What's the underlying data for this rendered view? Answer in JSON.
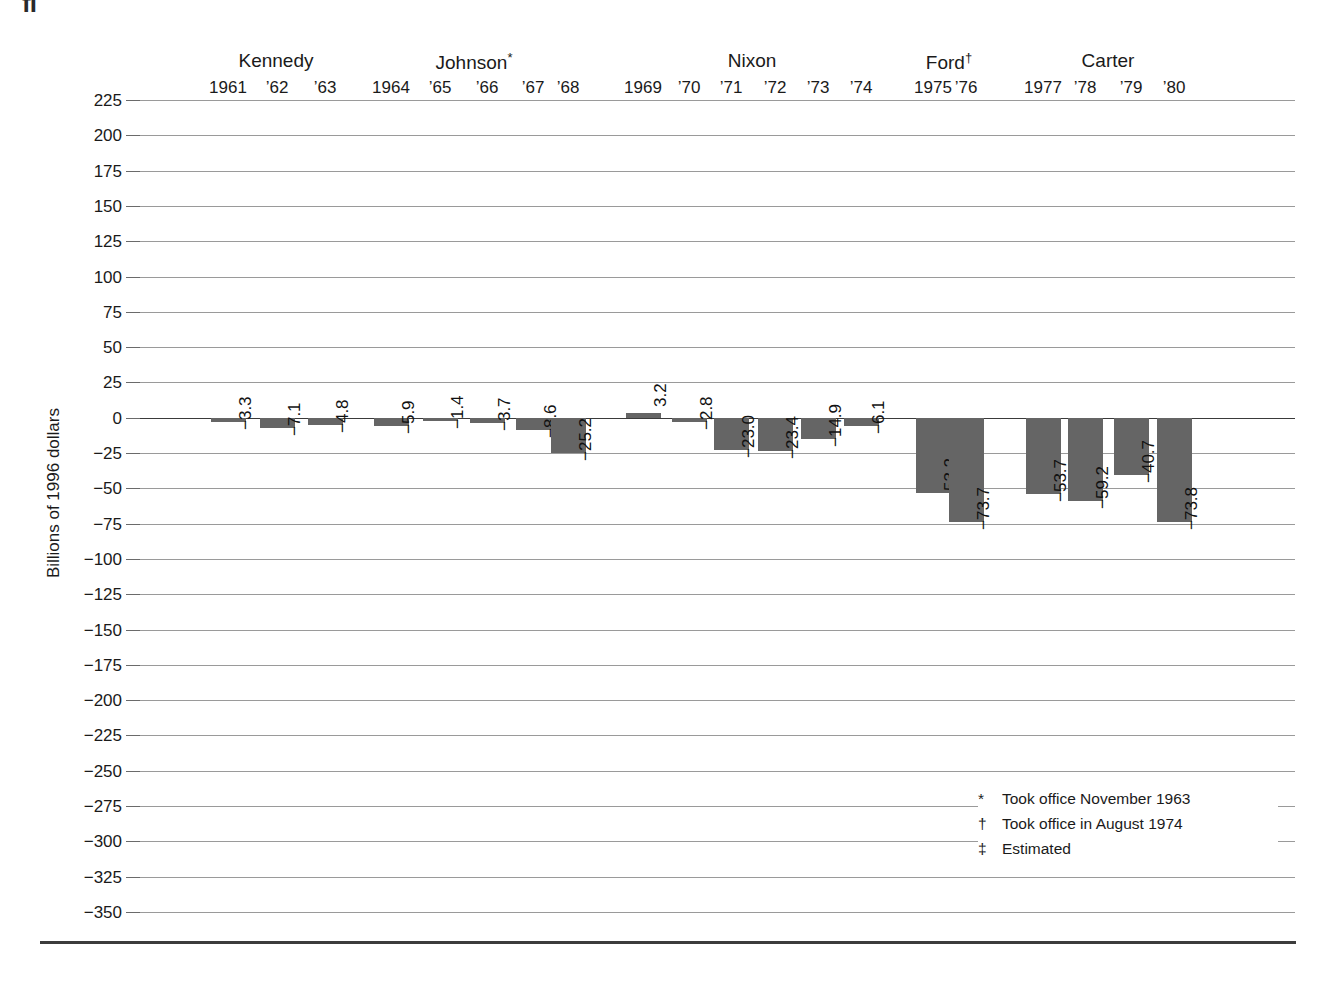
{
  "page": {
    "clipped_glyph": "fi"
  },
  "axis": {
    "y_title": "Billions of 1996 dollars",
    "y_ticks": [
      225,
      200,
      175,
      150,
      125,
      100,
      75,
      50,
      25,
      0,
      -25,
      -50,
      -75,
      -100,
      -125,
      -150,
      -175,
      -200,
      -225,
      -250,
      -275,
      -300,
      -325,
      -350
    ],
    "y_tick_labels": [
      "225",
      "200",
      "175",
      "150",
      "125",
      "100",
      "75",
      "50",
      "25",
      "0",
      "−25",
      "−50",
      "−75",
      "−100",
      "−125",
      "−150",
      "−175",
      "−200",
      "−225",
      "−250",
      "−275",
      "−300",
      "−325",
      "−350"
    ],
    "ylim": [
      -350,
      225
    ]
  },
  "presidents": [
    {
      "name": "Kennedy",
      "marker": "",
      "years": [
        "1961",
        "’62",
        "’63"
      ]
    },
    {
      "name": "Johnson",
      "marker": "*",
      "years": [
        "1964",
        "’65",
        "’66",
        "’67",
        "’68"
      ]
    },
    {
      "name": "Nixon",
      "marker": "",
      "years": [
        "1969",
        "’70",
        "’71",
        "’72",
        "’73",
        "’74"
      ]
    },
    {
      "name": "Ford",
      "marker": "†",
      "years": [
        "1975",
        "’76"
      ]
    },
    {
      "name": "Carter",
      "marker": "",
      "years": [
        "1977",
        "’78",
        "’79",
        "’80"
      ]
    }
  ],
  "footnotes": [
    {
      "mark": "*",
      "text": "Took office November 1963"
    },
    {
      "mark": "†",
      "text": "Took office in August 1974"
    },
    {
      "mark": "‡",
      "text": "Estimated"
    }
  ],
  "colors": {
    "bar": "#656565",
    "gridline": "#9a9a9a",
    "zero_line": "#3a3a3a",
    "text": "#1a1a1a",
    "rule": "#3c3c3c"
  },
  "chart_data": {
    "type": "bar",
    "title": "",
    "xlabel": "",
    "ylabel": "Billions of 1996 dollars",
    "ylim": [
      -350,
      225
    ],
    "grid": true,
    "legend": "none",
    "categories": [
      "1961",
      "1962",
      "1963",
      "1964",
      "1965",
      "1966",
      "1967",
      "1968",
      "1969",
      "1970",
      "1971",
      "1972",
      "1973",
      "1974",
      "1975",
      "1976",
      "1977",
      "1978",
      "1979",
      "1980"
    ],
    "tick_labels": [
      "1961",
      "’62",
      "’63",
      "1964",
      "’65",
      "’66",
      "’67",
      "’68",
      "1969",
      "’70",
      "’71",
      "’72",
      "’73",
      "’74",
      "1975",
      "’76",
      "1977",
      "’78",
      "’79",
      "’80"
    ],
    "values": [
      -3.3,
      -7.1,
      -4.8,
      -5.9,
      -1.4,
      -3.7,
      -8.6,
      -25.2,
      3.2,
      -2.8,
      -23.0,
      -23.4,
      -14.9,
      -6.1,
      -53.2,
      -73.7,
      -53.7,
      -59.2,
      -40.7,
      -73.8
    ],
    "data_labels": [
      "−3.3",
      "−7.1",
      "−4.8",
      "−5.9",
      "−1.4",
      "−3.7",
      "−8.6",
      "−25.2",
      "3.2",
      "−2.8",
      "−23.0",
      "−23.4",
      "−14.9",
      "−6.1",
      "−53.2",
      "−73.7",
      "−53.7",
      "−59.2",
      "−40.7",
      "−73.8"
    ],
    "groups": [
      {
        "label": "Kennedy",
        "categories": [
          "1961",
          "1962",
          "1963"
        ]
      },
      {
        "label": "Johnson*",
        "categories": [
          "1964",
          "1965",
          "1966",
          "1967",
          "1968"
        ]
      },
      {
        "label": "Nixon",
        "categories": [
          "1969",
          "1970",
          "1971",
          "1972",
          "1973",
          "1974"
        ]
      },
      {
        "label": "Ford†",
        "categories": [
          "1975",
          "1976"
        ]
      },
      {
        "label": "Carter",
        "categories": [
          "1977",
          "1978",
          "1979",
          "1980"
        ]
      }
    ]
  },
  "layout": {
    "group_name_x": [
      276,
      474,
      752,
      949,
      1108
    ],
    "bar_centers": [
      228,
      277,
      325,
      391,
      440,
      487,
      533,
      568,
      643,
      689,
      731,
      775,
      818,
      861,
      933,
      966,
      1043,
      1085,
      1131,
      1174
    ],
    "bar_width": 35
  }
}
